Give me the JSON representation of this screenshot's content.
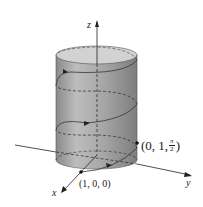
{
  "diagram": {
    "type": "3d-helix-on-cylinder",
    "axes": {
      "x_label": "x",
      "y_label": "y",
      "z_label": "z"
    },
    "points": [
      {
        "label": "(1, 0, 0)",
        "x": 1,
        "y": 0,
        "z": 0
      },
      {
        "label_prefix": "(0, 1, ",
        "label_frac_num": "π",
        "label_frac_den": "2",
        "label_suffix": ")",
        "x": 0,
        "y": 1,
        "z": "π/2"
      }
    ],
    "colors": {
      "cylinder_fill": "#9a9a9a",
      "cylinder_top": "#cfcfcf",
      "curve": "#333333",
      "axis": "#222222"
    }
  }
}
